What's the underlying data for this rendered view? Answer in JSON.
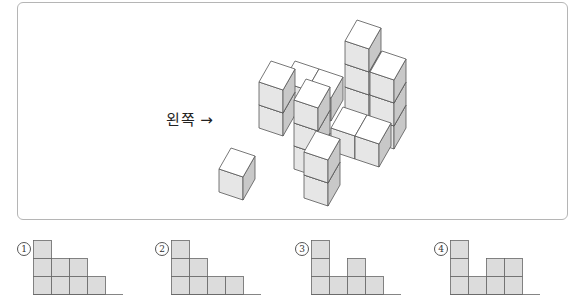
{
  "problem": {
    "direction_label": "왼쪽",
    "direction_arrow": "→"
  },
  "colors": {
    "frame_border": "#b5b5b5",
    "cube_top": "#ffffff",
    "cube_front": "#e6e6e6",
    "cube_side": "#c8c8c8",
    "cube_edge": "#555555",
    "option_fill": "#dcdcdc",
    "option_edge": "#666666"
  },
  "cube_projection": {
    "x_vec": [
      24,
      8
    ],
    "y_vec": [
      12,
      -21
    ],
    "z_vec": [
      0,
      -23
    ]
  },
  "cubes": [
    {
      "name": "back-hidden-1",
      "ftl": [
        283,
        82
      ],
      "h": 1
    },
    {
      "name": "back-hidden-2",
      "ftl": [
        307,
        90
      ],
      "h": 1
    },
    {
      "name": "right-tall-tower",
      "ftl": [
        345,
        41
      ],
      "levels": 3
    },
    {
      "name": "right-back-tower",
      "ftl": [
        370,
        72
      ],
      "levels": 3
    },
    {
      "name": "left-tower",
      "ftl": [
        259,
        82
      ],
      "levels": 2
    },
    {
      "name": "middle-tower",
      "ftl": [
        294,
        100
      ],
      "levels": 3
    },
    {
      "name": "flat-cube-1",
      "ftl": [
        331,
        128
      ],
      "levels": 1
    },
    {
      "name": "flat-cube-2",
      "ftl": [
        355,
        136
      ],
      "levels": 1
    },
    {
      "name": "front-tower",
      "ftl": [
        304,
        152
      ],
      "levels": 2
    },
    {
      "name": "isolated-cube",
      "ftl": [
        219,
        169
      ],
      "levels": 1
    }
  ],
  "options": [
    {
      "number": "①",
      "x": 17,
      "heights": [
        3,
        2,
        2,
        1
      ]
    },
    {
      "number": "②",
      "x": 155,
      "heights": [
        3,
        2,
        1,
        1
      ]
    },
    {
      "number": "③",
      "x": 295,
      "heights": [
        3,
        1,
        2,
        1
      ]
    },
    {
      "number": "④",
      "x": 434,
      "heights": [
        3,
        1,
        2,
        2
      ]
    }
  ]
}
